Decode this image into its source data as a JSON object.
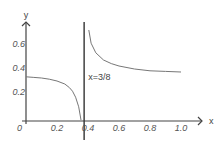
{
  "chart_data": {
    "type": "line",
    "title": "",
    "xlabel": "x",
    "ylabel": "y",
    "origin_label": "0",
    "xlim": [
      0,
      1.1
    ],
    "ylim": [
      0,
      0.7
    ],
    "x_ticks": [
      "0.2",
      "0.4",
      "0.6",
      "0.8",
      "1.0"
    ],
    "x_tick_values": [
      0.2,
      0.4,
      0.6,
      0.8,
      1.0
    ],
    "y_ticks": [
      "0.2",
      "0.4",
      "0.6"
    ],
    "y_tick_values": [
      0.2,
      0.4,
      0.6
    ],
    "grid": false,
    "asymptote": {
      "x": 0.375,
      "label": "x=3/8"
    },
    "series": [
      {
        "name": "left-branch",
        "x": [
          0.0,
          0.05,
          0.1,
          0.15,
          0.2,
          0.25,
          0.28,
          0.3,
          0.32,
          0.34,
          0.355
        ],
        "y": [
          0.36,
          0.355,
          0.35,
          0.34,
          0.325,
          0.3,
          0.27,
          0.24,
          0.19,
          0.11,
          0.0
        ]
      },
      {
        "name": "right-branch",
        "x": [
          0.405,
          0.42,
          0.45,
          0.5,
          0.55,
          0.6,
          0.7,
          0.8,
          0.9,
          1.0
        ],
        "y": [
          0.75,
          0.64,
          0.56,
          0.5,
          0.47,
          0.45,
          0.425,
          0.41,
          0.405,
          0.4
        ]
      }
    ],
    "colors": {
      "axis": "#444444",
      "curve": "#777777"
    }
  }
}
